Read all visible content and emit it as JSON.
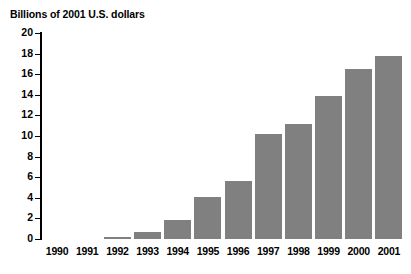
{
  "chart_data": {
    "type": "bar",
    "title": "Billions of 2001 U.S. dollars",
    "xlabel": "",
    "ylabel": "",
    "ylim": [
      0,
      20
    ],
    "ytick_step": 2,
    "yticks": [
      "20",
      "18",
      "16",
      "14",
      "12",
      "10",
      "8",
      "6",
      "4",
      "2",
      "0"
    ],
    "grid": false,
    "legend": null,
    "bar_color": "#808080",
    "axis_color": "#000000",
    "background": "#ffffff",
    "categories": [
      "1990",
      "1991",
      "1992",
      "1993",
      "1994",
      "1995",
      "1996",
      "1997",
      "1998",
      "1999",
      "2000",
      "2001"
    ],
    "values": [
      0,
      0,
      0.2,
      0.65,
      1.8,
      4.05,
      5.6,
      10.2,
      11.2,
      13.9,
      16.5,
      17.8
    ]
  },
  "caption": {
    "sliver_text": ""
  }
}
